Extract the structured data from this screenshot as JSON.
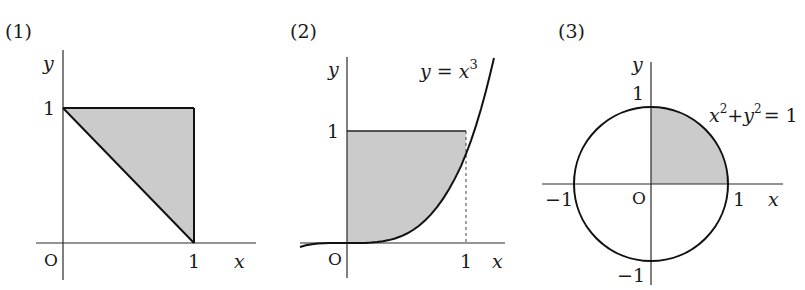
{
  "colors": {
    "shade": "#cbcbcb",
    "ink": "#111111",
    "background": "#ffffff"
  },
  "figures": [
    {
      "label": "(1)",
      "axis_x": "x",
      "axis_y": "y",
      "origin": "O",
      "tick_x": "1",
      "tick_y": "1",
      "description": "Triangle with vertices (0,1), (1,1), (1,0), shaded"
    },
    {
      "label": "(2)",
      "axis_x": "x",
      "axis_y": "y",
      "origin": "O",
      "tick_x": "1",
      "tick_y": "1",
      "curve_label_lhs": "y = x",
      "curve_label_exp": "3",
      "description": "Region between y-axis, y=1 and curve y=x^3, shaded; dashed line at x=1"
    },
    {
      "label": "(3)",
      "axis_x": "x",
      "axis_y": "y",
      "origin": "O",
      "tick_x_pos": "1",
      "tick_x_neg": "−1",
      "tick_y_pos": "1",
      "tick_y_neg": "−1",
      "circle_label": {
        "a": "x",
        "a_exp": "2",
        "plus": "+",
        "b": "y",
        "b_exp": "2",
        "rhs": "= 1"
      },
      "description": "Unit circle x^2+y^2=1 with first-quadrant quarter disc shaded"
    }
  ]
}
